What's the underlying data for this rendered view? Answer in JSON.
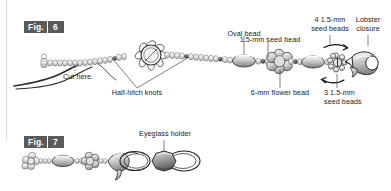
{
  "figures": [
    {
      "id": "fig6",
      "word": "Fig.",
      "number": "6",
      "caption_labels": [
        {
          "key": "oval_bead",
          "text": "Oval bead"
        },
        {
          "key": "seed_bead_15",
          "text": "1.5-mm seed bead"
        },
        {
          "key": "four_seed_beads",
          "text": "4 1.5-mm\nseed beads"
        },
        {
          "key": "lobster_closure",
          "text": "Lobster\nclosure"
        },
        {
          "key": "cut_here",
          "text": "Cut here."
        },
        {
          "key": "half_hitch_knots",
          "text": "Half-hitch knots"
        },
        {
          "key": "flower_bead",
          "text": "6-mm flower bead"
        },
        {
          "key": "three_seed_beads",
          "text": "3 1.5-mm\nseed beads"
        }
      ]
    },
    {
      "id": "fig7",
      "word": "Fig.",
      "number": "7",
      "caption_labels": [
        {
          "key": "eyeglass_holder",
          "text": "Eyeglass holder"
        }
      ]
    }
  ],
  "labels": {
    "oval_bead": "Oval bead",
    "seed_bead_15": "1.5-mm seed bead",
    "four_seed_beads": "4 1.5-mm\nseed beads",
    "lobster_closure": "Lobster\nclosure",
    "cut_here": "Cut here.",
    "half_hitch_knots": "Half-hitch knots",
    "flower_bead": "6-mm flower bead",
    "three_seed_beads": "3 1.5-mm\nseed beads",
    "eyeglass_holder": "Eyeglass holder"
  },
  "fig6": {
    "word": "Fig.",
    "number": "6"
  },
  "fig7": {
    "word": "Fig.",
    "number": "7"
  },
  "colors": {
    "badge_background": "#5a5a5a",
    "badge_text": "#ffffff",
    "label_text": "#1a1a1a",
    "line": "#2b2b2b",
    "rule": "#d9d9d9",
    "bead_light": "#f0f0f0",
    "bead_mid": "#c9c9c9",
    "bead_dark": "#8d8d8d",
    "page_background": "#ffffff"
  }
}
